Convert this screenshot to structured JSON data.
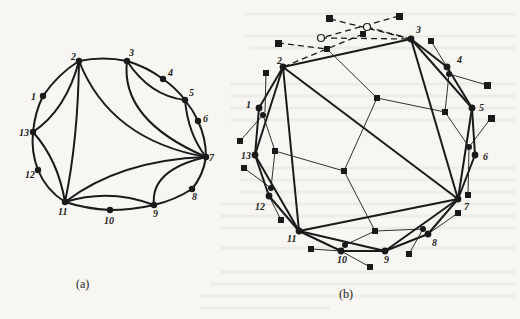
{
  "figure": {
    "panel_a": {
      "caption": "(a)",
      "nodes": [
        {
          "id": "1",
          "x": 43,
          "y": 96,
          "lx": 31,
          "ly": 100
        },
        {
          "id": "2",
          "x": 79,
          "y": 61,
          "lx": 71,
          "ly": 60
        },
        {
          "id": "3",
          "x": 127,
          "y": 61,
          "lx": 129,
          "ly": 56
        },
        {
          "id": "4",
          "x": 163,
          "y": 79,
          "lx": 168,
          "ly": 76
        },
        {
          "id": "5",
          "x": 185,
          "y": 100,
          "lx": 189,
          "ly": 96
        },
        {
          "id": "6",
          "x": 198,
          "y": 121,
          "lx": 203,
          "ly": 122
        },
        {
          "id": "7",
          "x": 206,
          "y": 157,
          "lx": 209,
          "ly": 161
        },
        {
          "id": "8",
          "x": 192,
          "y": 189,
          "lx": 192,
          "ly": 200
        },
        {
          "id": "9",
          "x": 154,
          "y": 205,
          "lx": 153,
          "ly": 217
        },
        {
          "id": "10",
          "x": 110,
          "y": 210,
          "lx": 104,
          "ly": 224
        },
        {
          "id": "11",
          "x": 65,
          "y": 202,
          "lx": 58,
          "ly": 215
        },
        {
          "id": "12",
          "x": 38,
          "y": 170,
          "lx": 25,
          "ly": 178
        },
        {
          "id": "13",
          "x": 33,
          "y": 132,
          "lx": 19,
          "ly": 136
        }
      ]
    },
    "panel_b": {
      "caption": "(b)",
      "nodes": [
        {
          "id": "1",
          "x": 259,
          "y": 108,
          "lx": 246,
          "ly": 108
        },
        {
          "id": "2",
          "x": 283,
          "y": 67,
          "lx": 277,
          "ly": 64
        },
        {
          "id": "3",
          "x": 411,
          "y": 39,
          "lx": 416,
          "ly": 33
        },
        {
          "id": "4",
          "x": 447,
          "y": 67,
          "lx": 457,
          "ly": 63
        },
        {
          "id": "5",
          "x": 472,
          "y": 108,
          "lx": 479,
          "ly": 111
        },
        {
          "id": "6",
          "x": 475,
          "y": 155,
          "lx": 483,
          "ly": 160
        },
        {
          "id": "7",
          "x": 458,
          "y": 199,
          "lx": 464,
          "ly": 210
        },
        {
          "id": "8",
          "x": 428,
          "y": 234,
          "lx": 432,
          "ly": 246
        },
        {
          "id": "9",
          "x": 385,
          "y": 251,
          "lx": 384,
          "ly": 263
        },
        {
          "id": "10",
          "x": 341,
          "y": 251,
          "lx": 337,
          "ly": 263
        },
        {
          "id": "11",
          "x": 299,
          "y": 231,
          "lx": 287,
          "ly": 242
        },
        {
          "id": "12",
          "x": 269,
          "y": 196,
          "lx": 255,
          "ly": 210
        },
        {
          "id": "13",
          "x": 255,
          "y": 155,
          "lx": 241,
          "ly": 159
        }
      ]
    }
  }
}
